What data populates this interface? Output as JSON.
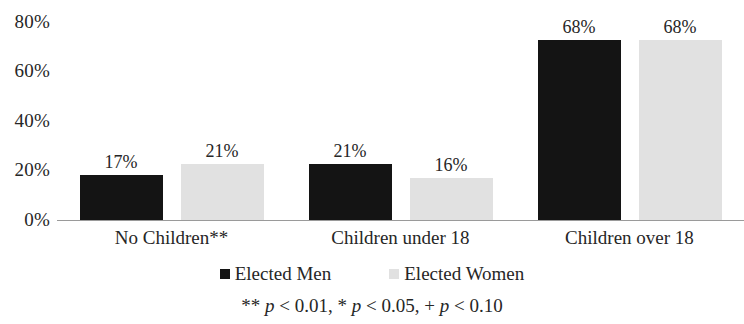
{
  "chart_data": {
    "type": "bar",
    "title": "",
    "xlabel": "",
    "ylabel": "",
    "ylim": [
      0,
      80
    ],
    "ytick_labels": [
      "0%",
      "20%",
      "40%",
      "60%",
      "80%"
    ],
    "ytick_values": [
      0,
      20,
      40,
      60,
      80
    ],
    "grid": false,
    "legend_position": "bottom",
    "categories": [
      "No Children**",
      "Children under 18",
      "Children over 18"
    ],
    "series": [
      {
        "name": "Elected Men",
        "color": "#141414",
        "values": [
          17,
          21,
          68
        ],
        "value_labels": [
          "17%",
          "21%",
          "68%"
        ]
      },
      {
        "name": "Elected Women",
        "color": "#e1e1e1",
        "values": [
          21,
          16,
          68
        ],
        "value_labels": [
          "21%",
          "16%",
          "68%"
        ]
      }
    ],
    "annotations": {
      "footnote_prefix": "** ",
      "footnote_p1": "p",
      "footnote_mid1": " < 0.01, * ",
      "footnote_p2": "p",
      "footnote_mid2": " < 0.05, + ",
      "footnote_p3": "p",
      "footnote_suffix": " < 0.10",
      "footnote_full": "** p < 0.01, * p < 0.05, + p < 0.10"
    }
  },
  "axis": {
    "y_ticks": [
      {
        "label": "80%",
        "value": 80
      },
      {
        "label": "60%",
        "value": 60
      },
      {
        "label": "40%",
        "value": 40
      },
      {
        "label": "20%",
        "value": 20
      },
      {
        "label": "0%",
        "value": 0
      }
    ]
  },
  "groups": [
    {
      "category": "No Children**",
      "men": {
        "label": "17%",
        "value": 17
      },
      "women": {
        "label": "21%",
        "value": 21
      }
    },
    {
      "category": "Children under 18",
      "men": {
        "label": "21%",
        "value": 21
      },
      "women": {
        "label": "16%",
        "value": 16
      }
    },
    {
      "category": "Children over 18",
      "men": {
        "label": "68%",
        "value": 68
      },
      "women": {
        "label": "68%",
        "value": 68
      }
    }
  ],
  "legend": {
    "men_label": "Elected Men",
    "women_label": "Elected Women"
  }
}
